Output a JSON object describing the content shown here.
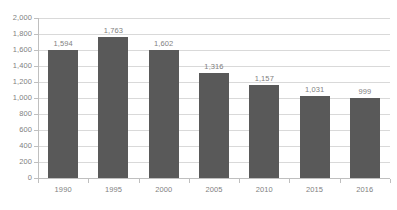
{
  "chart_data": {
    "type": "bar",
    "title": "",
    "subtitle": "",
    "xlabel": "",
    "ylabel": "",
    "categories": [
      "1990",
      "1995",
      "2000",
      "2005",
      "2010",
      "2015",
      "2016"
    ],
    "values": [
      1594,
      1763,
      1602,
      1316,
      1157,
      1031,
      999
    ],
    "value_labels": [
      "1,594",
      "1,763",
      "1,602",
      "1,316",
      "1,157",
      "1,031",
      "999"
    ],
    "ylim": [
      0,
      2000
    ],
    "ytick_step": 200,
    "ytick_labels": [
      "2,000",
      "1,800",
      "1,600",
      "1,400",
      "1,200",
      "1,000",
      "800",
      "600",
      "400",
      "200",
      "0"
    ],
    "ytick_values": [
      2000,
      1800,
      1600,
      1400,
      1200,
      1000,
      800,
      600,
      400,
      200,
      0
    ],
    "grid": true,
    "legend": false,
    "legend_position": "none",
    "colors": {
      "bar": "#595959",
      "gridline": "#d9d9d9",
      "axis_line": "#bfbfbf",
      "label_text": "#7f7f7f",
      "background": "#ffffff"
    }
  }
}
